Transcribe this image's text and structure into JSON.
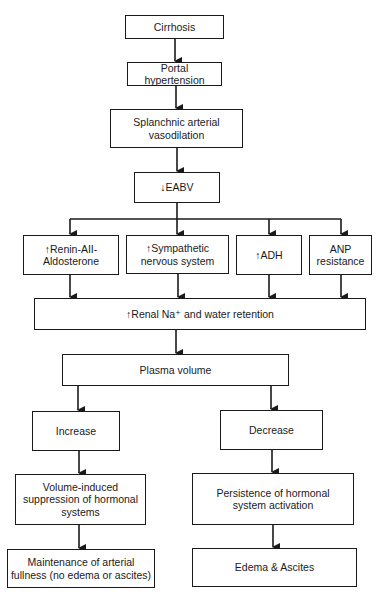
{
  "diagram": {
    "nodes": {
      "cirrhosis": "Cirrhosis",
      "portal_hypertension": "Portal hypertension",
      "splanchnic": "Splanchnic arterial vasodilation",
      "eabv": "↓EABV",
      "renin": "↑Renin-AII-Aldosterone",
      "sympathetic": "↑Sympathetic nervous system",
      "adh": "↑ADH",
      "anp": "ANP resistance",
      "renal": "↑Renal Na⁺ and water retention",
      "plasma": "Plasma volume",
      "increase": "Increase",
      "decrease": "Decrease",
      "volume_suppression": "Volume-induced suppression of hormonal systems",
      "persistence": "Persistence of hormonal system activation",
      "maintenance": "Maintenance of arterial fullness (no edema or ascites)",
      "edema": "Edema & Ascites"
    },
    "edges": [
      [
        "cirrhosis",
        "portal_hypertension"
      ],
      [
        "portal_hypertension",
        "splanchnic"
      ],
      [
        "splanchnic",
        "eabv"
      ],
      [
        "eabv",
        "renin"
      ],
      [
        "eabv",
        "sympathetic"
      ],
      [
        "eabv",
        "adh"
      ],
      [
        "eabv",
        "anp"
      ],
      [
        "renin",
        "renal"
      ],
      [
        "sympathetic",
        "renal"
      ],
      [
        "adh",
        "renal"
      ],
      [
        "anp",
        "renal"
      ],
      [
        "renal",
        "plasma"
      ],
      [
        "plasma",
        "increase"
      ],
      [
        "plasma",
        "decrease"
      ],
      [
        "increase",
        "volume_suppression"
      ],
      [
        "volume_suppression",
        "maintenance"
      ],
      [
        "decrease",
        "persistence"
      ],
      [
        "persistence",
        "edema"
      ]
    ],
    "colors": {
      "line": "#1a1a1a",
      "background": "#ffffff"
    }
  }
}
